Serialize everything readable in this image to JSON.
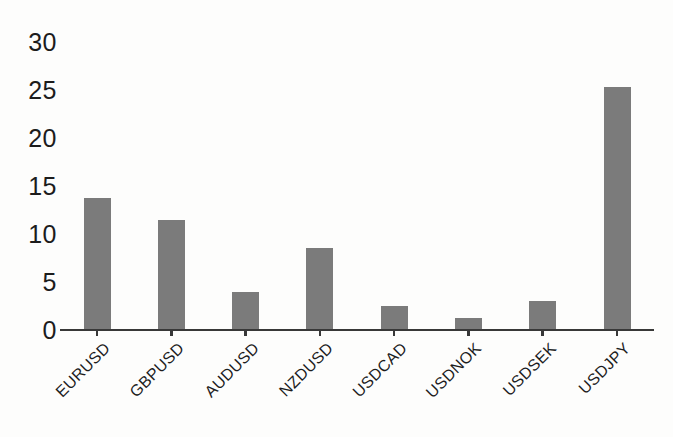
{
  "chart_data": {
    "type": "bar",
    "categories": [
      "EURUSD",
      "GBPUSD",
      "AUDUSD",
      "NZDUSD",
      "USDCAD",
      "USDNOK",
      "USDSEK",
      "USDJPY"
    ],
    "values": [
      13.8,
      11.5,
      4.0,
      8.5,
      2.5,
      1.2,
      3.0,
      25.3
    ],
    "title": "",
    "xlabel": "",
    "ylabel": "",
    "ylim": [
      0,
      30
    ],
    "yticks": [
      0,
      5,
      10,
      15,
      20,
      25,
      30
    ],
    "grid": false,
    "legend": null,
    "bar_color": "#7b7b7b",
    "axis_color": "#383838",
    "text_color": "#1c1c1c",
    "background": "#fdfdfc"
  }
}
